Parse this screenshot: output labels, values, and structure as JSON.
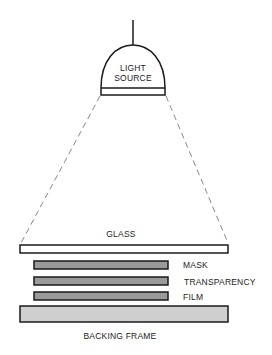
{
  "diagram": {
    "light_source": {
      "label_line1": "LIGHT",
      "label_line2": "SOURCE"
    },
    "layers": {
      "glass": {
        "label": "GLASS",
        "fill": "#ffffff"
      },
      "mask": {
        "label": "MASK",
        "fill": "#9a9a9a"
      },
      "transparency": {
        "label": "TRANSPARENCY",
        "fill": "#9a9a9a"
      },
      "film": {
        "label": "FILM",
        "fill": "#9a9a9a"
      },
      "backing_frame": {
        "label": "BACKING FRAME",
        "fill": "#cfcfcf"
      }
    },
    "colors": {
      "stroke": "#1a1a1a",
      "dashed_beam": "#888888"
    }
  }
}
